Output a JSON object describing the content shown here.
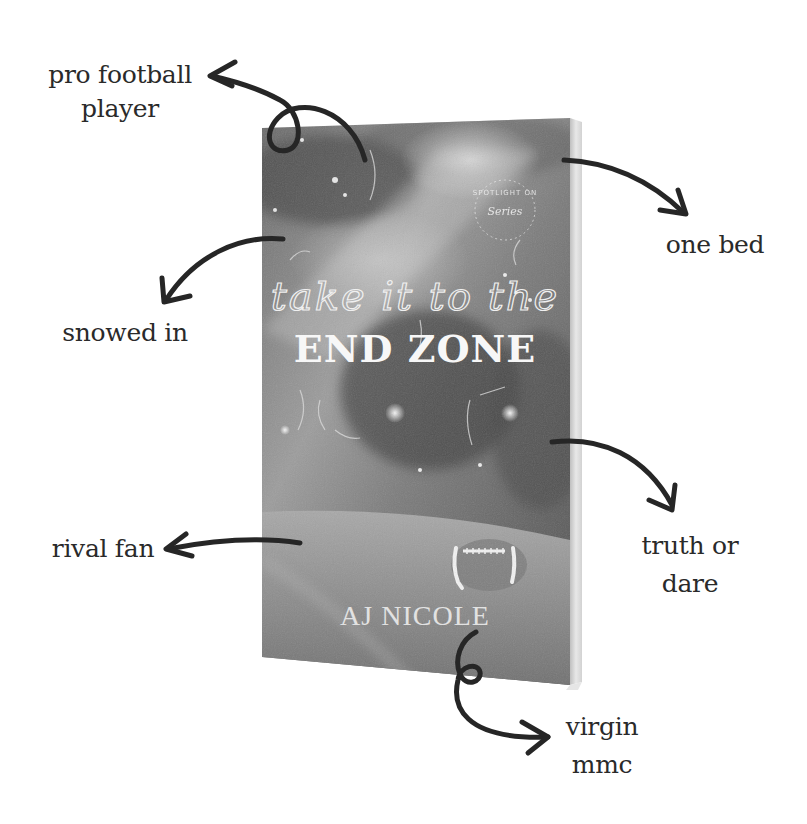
{
  "book": {
    "script_title": "take it to the",
    "main_title": "END ZONE",
    "author": "AJ NICOLE",
    "series_badge_top": "SPOTLIGHT ON",
    "series_badge_bottom": "Series"
  },
  "tropes": [
    {
      "id": "pro-football-player",
      "lines": [
        "pro football",
        "player"
      ]
    },
    {
      "id": "one-bed",
      "lines": [
        "one bed"
      ]
    },
    {
      "id": "snowed-in",
      "lines": [
        "snowed in"
      ]
    },
    {
      "id": "truth-or-dare",
      "lines": [
        "truth or",
        "dare"
      ]
    },
    {
      "id": "rival-fan",
      "lines": [
        "rival fan"
      ]
    },
    {
      "id": "virgin-mmc",
      "lines": [
        "virgin",
        "mmc"
      ]
    }
  ],
  "colors": {
    "background": "#ffffff",
    "ink": "#2a2a2a",
    "arrow": "#262626",
    "cover_dark": "#5a5a5a",
    "cover_light": "#b8b8b8",
    "spine": "#d9d9d9"
  }
}
